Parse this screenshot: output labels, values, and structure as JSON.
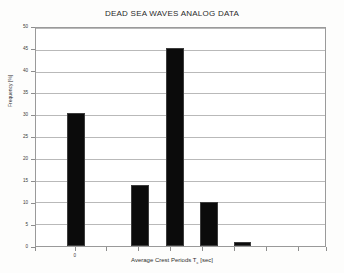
{
  "chart_data": {
    "type": "bar",
    "title": "DEAD SEA WAVES ANALOG DATA",
    "xlabel_prefix": "Average Crest Periods T",
    "xlabel_sub": "c",
    "xlabel_suffix": " [sec]",
    "xlabel": "Average Crest Periods Tc [sec]",
    "ylabel": "Frequency [%]",
    "categories": [
      "0",
      "",
      "",
      "",
      ""
    ],
    "values": [
      30.5,
      14.0,
      45.5,
      10.0,
      1.0
    ],
    "ylim": [
      0,
      50
    ],
    "y_ticks": [
      0,
      5,
      10,
      15,
      20,
      25,
      30,
      35,
      40,
      45,
      50
    ],
    "y_tick_labels": [
      "0",
      "5",
      "10",
      "15",
      "20",
      "25",
      "30",
      "35",
      "40",
      "45",
      "50"
    ],
    "x_tick_labels": [
      "",
      "0",
      "",
      "",
      "",
      "",
      "",
      "",
      ""
    ],
    "grid": true,
    "legend": "none",
    "bar_color": "#0b0b0b",
    "grid_color": "#b9b9b9",
    "axis_color": "#9a9a9a"
  },
  "bar_geometry": [
    {
      "left_pct": 10.65,
      "width_pct": 6.19,
      "value": 30.5
    },
    {
      "left_pct": 32.99,
      "width_pct": 6.19,
      "value": 14.0
    },
    {
      "left_pct": 45.02,
      "width_pct": 6.19,
      "value": 45.5
    },
    {
      "left_pct": 56.7,
      "width_pct": 6.19,
      "value": 10.0
    },
    {
      "left_pct": 68.38,
      "width_pct": 6.19,
      "value": 1.0
    }
  ],
  "x_tick_positions_pct": [
    0,
    13.7,
    24.4,
    35.4,
    46.4,
    57.4,
    68.4,
    79.4,
    90.4,
    100
  ]
}
